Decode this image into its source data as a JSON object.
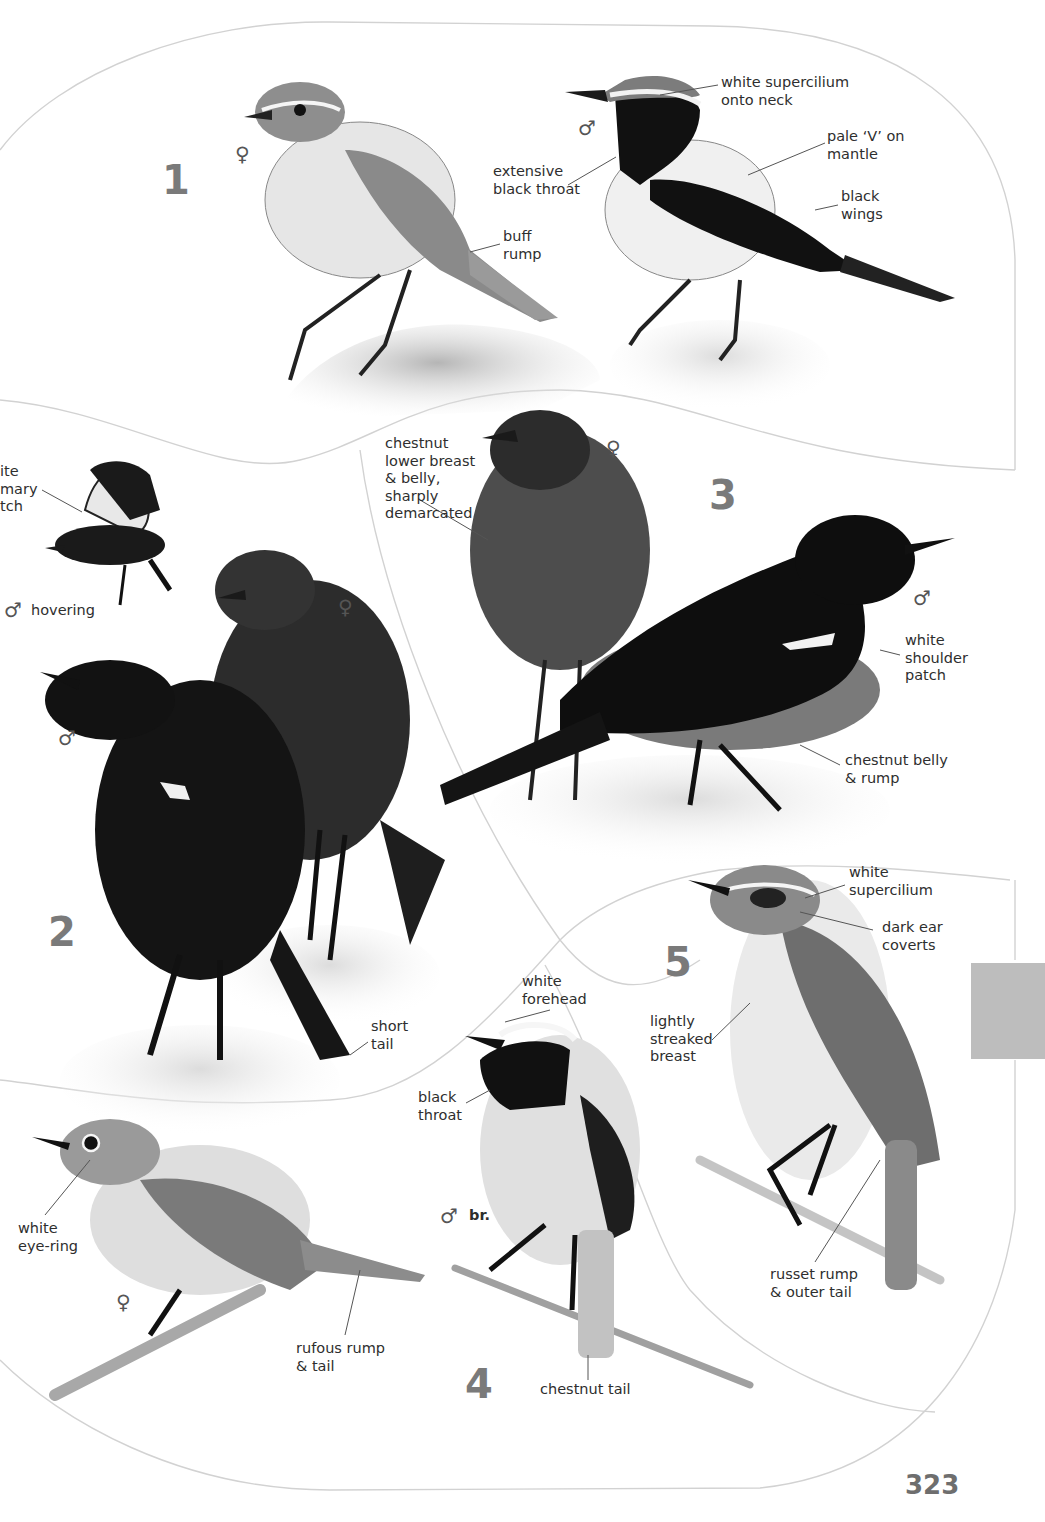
{
  "page": {
    "page_number": "323",
    "thumb_tab_color": "#bdbdbd",
    "outline_color": "#d0d0d0",
    "number_color": "#7a7a7a"
  },
  "plates": [
    {
      "number": "1",
      "birds": [
        {
          "sex": "♀",
          "sex_name": "female",
          "labels": [
            "buff\nrump"
          ]
        },
        {
          "sex": "♂",
          "sex_name": "male",
          "labels": [
            "white supercilium\nonto neck",
            "pale ‘V’ on\nmantle",
            "extensive\nblack throat",
            "black\nwings"
          ]
        }
      ]
    },
    {
      "number": "2",
      "birds": [
        {
          "sex": "♂",
          "sex_name": "male",
          "pose": "hovering",
          "labels": [
            "ite\nmary\ntch"
          ]
        },
        {
          "sex": "♀",
          "sex_name": "female",
          "labels": []
        },
        {
          "sex": "♂",
          "sex_name": "male",
          "labels": [
            "short\ntail"
          ]
        }
      ]
    },
    {
      "number": "3",
      "birds": [
        {
          "sex": "♀",
          "sex_name": "female",
          "labels": [
            "chestnut\nlower breast\n& belly,\nsharply\ndemarcated"
          ]
        },
        {
          "sex": "♂",
          "sex_name": "male",
          "labels": [
            "white\nshoulder\npatch",
            "chestnut belly\n& rump"
          ]
        }
      ]
    },
    {
      "number": "4",
      "birds": [
        {
          "sex": "♀",
          "sex_name": "female",
          "labels": [
            "white\neye-ring",
            "rufous rump\n& tail"
          ]
        },
        {
          "sex": "♂",
          "sex_name": "male",
          "status": "br.",
          "labels": [
            "white\nforehead",
            "black\nthroat",
            "chestnut tail"
          ]
        }
      ]
    },
    {
      "number": "5",
      "birds": [
        {
          "sex": "",
          "labels": [
            "white\nsupercilium",
            "dark ear\ncoverts",
            "lightly\nstreaked\nbreast",
            "russet rump\n& outer tail"
          ]
        }
      ]
    }
  ]
}
